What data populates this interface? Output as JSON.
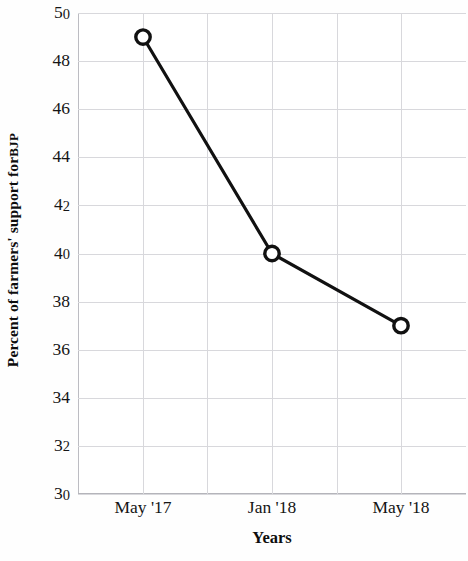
{
  "chart_data": {
    "type": "line",
    "title": "",
    "xlabel": "Years",
    "ylabel": "Percent of farmers' support for BJP",
    "ylabel_main": "Percent of farmers' support for",
    "ylabel_smallcaps": "BJP",
    "categories": [
      "May '17",
      "Jan '18",
      "May '18"
    ],
    "values": [
      49,
      40,
      37
    ],
    "series": [
      {
        "name": "Percent of farmers' support for BJP",
        "values": [
          49,
          40,
          37
        ]
      }
    ],
    "ylim": [
      30,
      50
    ],
    "yticks": [
      50,
      48,
      46,
      44,
      42,
      40,
      38,
      36,
      34,
      32,
      30
    ],
    "ytick_labels": [
      "50",
      "48",
      "46",
      "44",
      "42",
      "40",
      "38",
      "36",
      "34",
      "32",
      "30"
    ],
    "xtick_labels": [
      "May '17",
      "Jan '18",
      "May '18"
    ],
    "grid": true,
    "grid_color": "#d8d8dc",
    "legend": "none",
    "line_color": "#111111",
    "marker": "open-circle",
    "marker_face_color": "#ffffff",
    "marker_edge_color": "#111111",
    "background_color": "#ffffff",
    "vertical_gridline_count": 6,
    "points": [
      {
        "x": "May '17",
        "y": 49
      },
      {
        "x": "Jan '18",
        "y": 40
      },
      {
        "x": "May '18",
        "y": 37
      }
    ]
  }
}
